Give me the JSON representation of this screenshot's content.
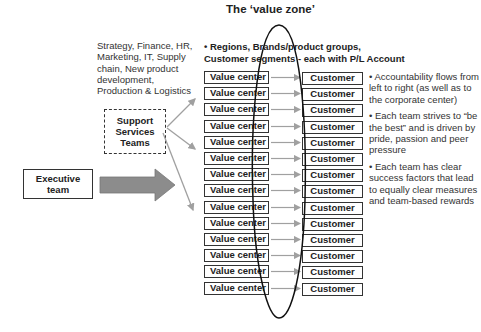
{
  "title": "The ‘value zone’",
  "functions_text": "Strategy, Finance, HR, Marketing, IT, Supply chain, New product development, Production & Logistics",
  "support_box": {
    "line1": "Support",
    "line2": "Services",
    "line3": "Teams"
  },
  "executive_box": {
    "line1": "Executive",
    "line2": "team"
  },
  "regions_text": {
    "line1": "• Regions, Brands/product groups,",
    "line2": "Customer segments - each with P/L Account"
  },
  "rows": [
    {
      "left": "Value center",
      "right": "Customer"
    },
    {
      "left": "Value center",
      "right": "Customer"
    },
    {
      "left": "Value center",
      "right": "Customer"
    },
    {
      "left": "Value center",
      "right": "Customer"
    },
    {
      "left": "Value center",
      "right": "Customer"
    },
    {
      "left": "Value center",
      "right": "Customer"
    },
    {
      "left": "Value center",
      "right": "Customer"
    },
    {
      "left": "Value center",
      "right": "Customer"
    },
    {
      "left": "Value center",
      "right": "Customer"
    },
    {
      "left": "Value center",
      "right": "Customer"
    },
    {
      "left": "Value center",
      "right": "Customer"
    },
    {
      "left": "Value center",
      "right": "Customer"
    },
    {
      "left": "Value center",
      "right": "Customer"
    },
    {
      "left": "Value center",
      "right": "Customer"
    }
  ],
  "bullets": [
    "• Accountability flows from left to right (as well as to the corporate center)",
    "• Each team strives to “be the best” and is driven by pride, passion and peer pressure",
    "• Each team has clear success factors that lead to equally clear measures and team-based rewards"
  ],
  "colors": {
    "arrow_gray": "#8c8c8c",
    "connector_gray": "#a0a0a0",
    "border": "#333333"
  }
}
